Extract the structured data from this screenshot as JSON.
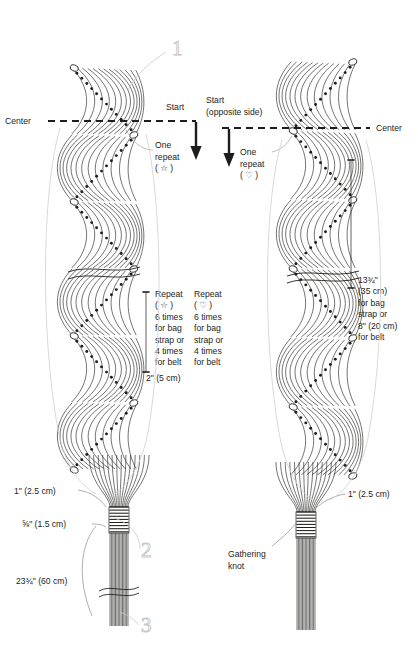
{
  "page": {
    "bg_color": "#ffffff",
    "ink_color": "#1d1d1b",
    "leader_color": "#9b9b9b",
    "callout_color": "#c9c9c9",
    "width": 418,
    "height": 657
  },
  "labels": {
    "center_left": "Center",
    "center_right": "Center",
    "start_left": "Start",
    "start_right_line1": "Start",
    "start_right_line2": "(opposite side)",
    "one_repeat_left_l1": "One",
    "one_repeat_left_l2": "repeat",
    "one_repeat_left_l3": "( ☆ )",
    "one_repeat_right_l1": "One",
    "one_repeat_right_l2": "repeat",
    "one_repeat_right_l3": "( ♡ )",
    "repeat_left": [
      "Repeat",
      "( ☆ )",
      "6 times",
      "for bag",
      "strap or",
      "4 times",
      "for belt"
    ],
    "repeat_right": [
      "Repeat",
      "( ♡ )",
      "6 times",
      "for bag",
      "strap or",
      "4 times",
      "for belt"
    ],
    "dim_two_inch": "2\" (5 cm)",
    "length_right": [
      "13¾\"",
      "(35 cm)",
      "for bag",
      "strap or",
      "8\" (20 cm)",
      "for belt"
    ],
    "dim_one_inch_left": "1\" (2.5 cm)",
    "dim_one_inch_right": "1\" (2.5 cm)",
    "dim_five_eighths": "⅝\" (1.5 cm)",
    "dim_tail_length": "23¾\" (60 cm)",
    "gathering_knot_l1": "Gathering",
    "gathering_knot_l2": "knot"
  },
  "callouts": {
    "one": "1",
    "two": "2",
    "three": "3"
  },
  "symbols": {
    "star": "☆",
    "heart": "♡"
  },
  "icons": {
    "start_arrow_left": "down-arrow-icon",
    "start_arrow_right": "down-arrow-icon",
    "center_dash_left": "dashed-center-line-icon",
    "center_dash_right": "dashed-center-line-icon",
    "break_squiggle_left": "break-line-icon",
    "break_squiggle_right": "break-line-icon",
    "break_squiggle_tail": "break-line-icon"
  }
}
